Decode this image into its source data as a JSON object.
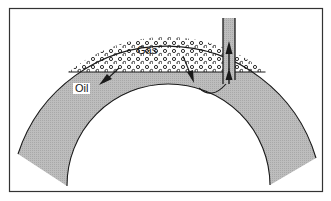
{
  "diagram": {
    "title": "",
    "labels": {
      "gas": "Gas",
      "oil": "Oil"
    },
    "regions": [
      {
        "id": "gas-cap",
        "label": "Gas",
        "fill": "dotted"
      },
      {
        "id": "oil-zone",
        "label": "Oil",
        "fill": "#b8b8b8"
      }
    ],
    "elements": [
      "anticline-reservoir-layer",
      "gas-oil-contact",
      "well-bore",
      "flow-arrows"
    ],
    "colors": {
      "stroke": "#1a1a1a",
      "oil_fill": "#b8b8b8",
      "background": "#ffffff"
    }
  }
}
